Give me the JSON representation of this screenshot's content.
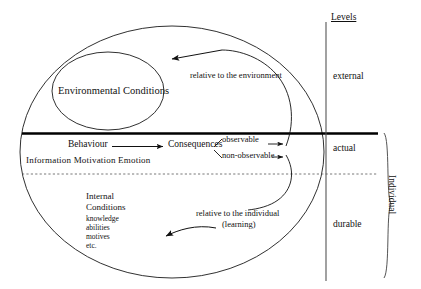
{
  "diagram": {
    "title_right": "Levels",
    "outer_region_label": "Individual",
    "ellipses": {
      "outer_label": "",
      "inner_label": "Environmental Conditions"
    },
    "flow": {
      "behaviour": "Behaviour",
      "consequences": "Consequences",
      "branch_top": "observable",
      "branch_bottom": "non-observable"
    },
    "determinants": "Information  Motivation  Emotion",
    "internal": {
      "line1": "Internal",
      "line2": "Conditions",
      "items": [
        "knowledge",
        "abilities",
        "motives",
        "etc."
      ]
    },
    "feedback": {
      "environment": "relative to the environment",
      "individual_line1": "relative to the individual",
      "individual_line2": "(learning)"
    },
    "levels": {
      "external": "external",
      "actual": "actual",
      "durable": "durable"
    },
    "colors": {
      "stroke": "#1a1a1a",
      "thick_divider": "#000000",
      "dotted_divider": "#555555",
      "background": "#ffffff"
    }
  }
}
